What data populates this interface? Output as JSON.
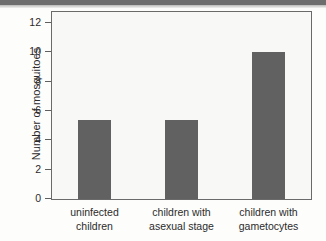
{
  "chart_data": {
    "type": "bar",
    "title": "",
    "subtitle": "",
    "xlabel": "",
    "ylabel": "Number of mosquitoes",
    "categories": [
      "uninfected children",
      "children with asexual stage",
      "children with gametocytes"
    ],
    "category_lines": [
      [
        "uninfected",
        "children"
      ],
      [
        "children with",
        "asexual stage"
      ],
      [
        "children with",
        "gametocytes"
      ]
    ],
    "values": [
      5.35,
      5.35,
      10.0
    ],
    "ylim": [
      0,
      12.8
    ],
    "yticks": [
      0,
      2,
      4,
      6,
      8,
      10,
      12
    ],
    "ytick_labels": [
      "0",
      "2",
      "4",
      "6",
      "8",
      "10",
      "12"
    ],
    "grid": false,
    "legend": false,
    "legend_position": "none",
    "bar_color": "#616161",
    "frame_color": "#6a6a6a",
    "plot_background": "#f8f8f6",
    "text_color": "#2b2b2b",
    "annotations": []
  }
}
